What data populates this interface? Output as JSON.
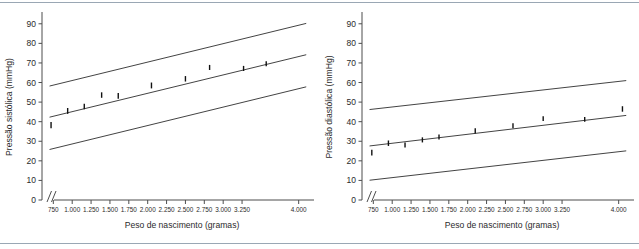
{
  "figure": {
    "background": "#ffffff",
    "rule_color": "#9aa7b4",
    "line_color": "#2e2e2e",
    "axis_color": "#4d4d4d",
    "marker_color": "#111111"
  },
  "chart_data": [
    {
      "type": "scatter",
      "panel_id": "systolic",
      "title": "",
      "xlabel": "Peso de nascimento (gramas)",
      "ylabel": "Pressão sistólica (mmHg)",
      "xlim": [
        600,
        4150
      ],
      "ylim": [
        0,
        95
      ],
      "grid": false,
      "legend": "none",
      "axis_break": true,
      "yticks": [
        0,
        10,
        20,
        30,
        40,
        50,
        60,
        70,
        80,
        90
      ],
      "ytick_labels": [
        "0",
        "10",
        "20",
        "30",
        "40",
        "50",
        "60",
        "70",
        "80",
        "90"
      ],
      "xticks": [
        750,
        1000,
        1250,
        1500,
        1750,
        2000,
        2250,
        2500,
        2750,
        3000,
        3250,
        4000
      ],
      "xtick_labels": [
        "750",
        "1.000",
        "1.250",
        "1.500",
        "1.750",
        "2.000",
        "2.250",
        "2.500",
        "2.750",
        "3.000",
        "3.250",
        "4.000"
      ],
      "points": {
        "x": [
          720,
          940,
          1160,
          1390,
          1610,
          2050,
          2500,
          2820,
          3270,
          3570
        ],
        "y": [
          38.3,
          45.5,
          47.8,
          53.6,
          53.2,
          58.5,
          61.9,
          67.7,
          67.2,
          69.6
        ],
        "err": [
          1.6,
          1.5,
          1.4,
          1.4,
          1.5,
          1.5,
          1.4,
          1.3,
          1.3,
          1.3
        ]
      },
      "series": [
        {
          "name": "Limite superior",
          "type": "line",
          "x": [
            700,
            4100
          ],
          "y": [
            58.2,
            90.2
          ]
        },
        {
          "name": "Média estimada",
          "type": "line",
          "x": [
            700,
            4100
          ],
          "y": [
            42.3,
            74.2
          ]
        },
        {
          "name": "Limite inferior",
          "type": "line",
          "x": [
            700,
            4100
          ],
          "y": [
            25.8,
            57.8
          ]
        }
      ]
    },
    {
      "type": "scatter",
      "panel_id": "diastolic",
      "title": "",
      "xlabel": "Peso de nascimento (gramas)",
      "ylabel": "Pressão diastólica (mmHg)",
      "xlim": [
        600,
        4150
      ],
      "ylim": [
        0,
        95
      ],
      "grid": false,
      "legend": "none",
      "axis_break": true,
      "yticks": [
        0,
        10,
        20,
        30,
        40,
        50,
        60,
        70,
        80,
        90
      ],
      "ytick_labels": [
        "0",
        "10",
        "20",
        "30",
        "40",
        "50",
        "60",
        "70",
        "80",
        "90"
      ],
      "xticks": [
        750,
        1000,
        1250,
        1500,
        1750,
        2000,
        2250,
        2500,
        2750,
        3000,
        3250,
        4000
      ],
      "xtick_labels": [
        "750",
        "1.000",
        "1.250",
        "1.500",
        "1.750",
        "2.000",
        "2.250",
        "2.500",
        "2.750",
        "3.000",
        "3.250",
        "4.000"
      ],
      "points": {
        "x": [
          730,
          950,
          1170,
          1400,
          1620,
          2100,
          2600,
          3000,
          3550,
          4050
        ],
        "y": [
          24.2,
          29.0,
          28.1,
          30.7,
          32.2,
          35.3,
          37.9,
          41.6,
          41.2,
          46.5
        ],
        "err": [
          1.5,
          1.4,
          1.3,
          1.3,
          1.3,
          1.3,
          1.3,
          1.2,
          1.2,
          1.4
        ]
      },
      "series": [
        {
          "name": "Limite superior",
          "type": "line",
          "x": [
            700,
            4100
          ],
          "y": [
            46.2,
            61.0
          ]
        },
        {
          "name": "Média estimada",
          "type": "line",
          "x": [
            700,
            4100
          ],
          "y": [
            27.6,
            43.2
          ]
        },
        {
          "name": "Limite inferior",
          "type": "line",
          "x": [
            700,
            4100
          ],
          "y": [
            10.1,
            25.1
          ]
        }
      ]
    }
  ]
}
